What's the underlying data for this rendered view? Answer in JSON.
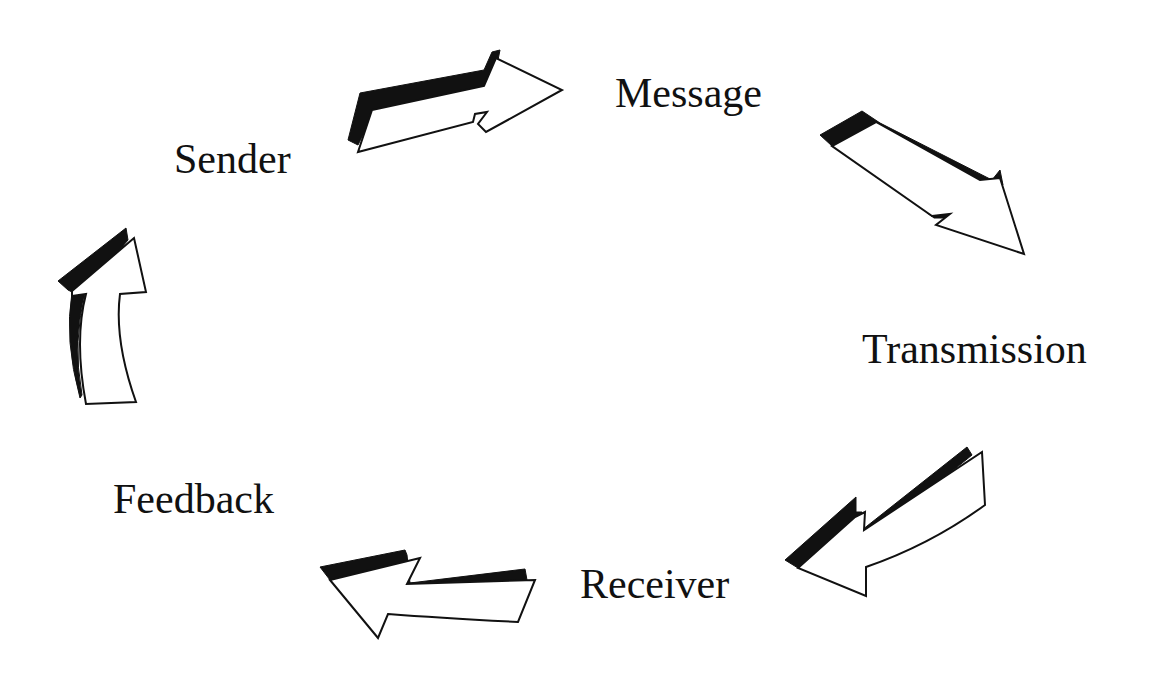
{
  "diagram": {
    "type": "cycle",
    "title": "",
    "nodes": [
      {
        "id": "sender",
        "label": "Sender"
      },
      {
        "id": "message",
        "label": "Message"
      },
      {
        "id": "transmission",
        "label": "Transmission"
      },
      {
        "id": "receiver",
        "label": "Receiver"
      },
      {
        "id": "feedback",
        "label": "Feedback"
      }
    ],
    "edges": [
      {
        "from": "sender",
        "to": "message",
        "style": "3d-block-arrow"
      },
      {
        "from": "message",
        "to": "transmission",
        "style": "3d-block-arrow"
      },
      {
        "from": "transmission",
        "to": "receiver",
        "style": "3d-block-arrow"
      },
      {
        "from": "receiver",
        "to": "feedback",
        "style": "3d-block-arrow"
      },
      {
        "from": "feedback",
        "to": "sender",
        "style": "3d-block-arrow"
      }
    ],
    "colors": {
      "background": "#ffffff",
      "text": "#111111",
      "arrow_fill": "#ffffff",
      "arrow_shadow": "#111111"
    }
  }
}
